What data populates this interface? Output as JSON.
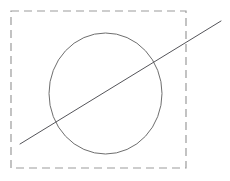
{
  "canvas": {
    "width": 230,
    "height": 181,
    "background_color": "#ffffff",
    "title": "Geometric figure: dashed bounding box with circle and diagonal line"
  },
  "shapes": {
    "bounding_box": {
      "name": "dashed-rectangle",
      "shape_type": "rect",
      "x": 11,
      "y": 11,
      "width": 175,
      "height": 157,
      "stroke_color": "#9b9b9b",
      "stroke_width": 1.2,
      "fill": "none",
      "dash_pattern": "8 5",
      "label": "Dashed selection boundary"
    },
    "circle": {
      "name": "circle-outline",
      "shape_type": "ellipse",
      "cx": 105.5,
      "cy": 93.5,
      "rx": 56.5,
      "ry": 60.5,
      "stroke_color": "#6e6e6e",
      "stroke_width": 1,
      "fill": "none",
      "label": "Circle outline"
    },
    "diagonal_line": {
      "name": "diagonal-line",
      "shape_type": "line",
      "x1": 20,
      "y1": 144,
      "x2": 221,
      "y2": 21,
      "stroke_color": "#55555a",
      "stroke_width": 1,
      "label": "Diagonal secant line"
    }
  }
}
